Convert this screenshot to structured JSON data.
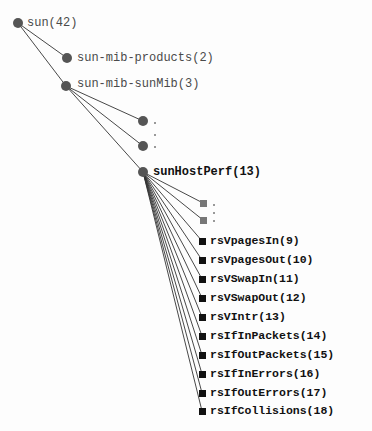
{
  "tree": {
    "root": {
      "label": "sun(42)"
    },
    "level1": [
      {
        "label": "sun-mib-products(2)"
      },
      {
        "label": "sun-mib-sunMib(3)"
      }
    ],
    "sunMib_children_collapsed": {
      "ellipsis": "..."
    },
    "sunHostPerf": {
      "label": "sunHostPerf(13)"
    },
    "sunHostPerf_collapsed": {
      "ellipsis": "..."
    },
    "leaves": [
      {
        "label": "rsVpagesIn(9)"
      },
      {
        "label": "rsVpagesOut(10)"
      },
      {
        "label": "rsVSwapIn(11)"
      },
      {
        "label": "rsVSwapOut(12)"
      },
      {
        "label": "rsVIntr(13)"
      },
      {
        "label": "rsIfInPackets(14)"
      },
      {
        "label": "rsIfOutPackets(15)"
      },
      {
        "label": "rsIfInErrors(16)"
      },
      {
        "label": "rsIfOutErrors(17)"
      },
      {
        "label": "rsIfCollisions(18)"
      }
    ]
  },
  "colors": {
    "edge": "#333333",
    "node": "#555555",
    "leaf_square": "#111111",
    "collapsed_square": "#777777"
  }
}
